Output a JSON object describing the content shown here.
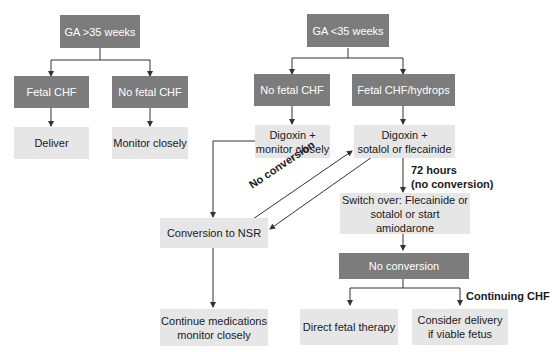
{
  "diagram": {
    "left_branch": {
      "root": "GA >35 weeks",
      "fetal_chf": "Fetal CHF",
      "no_fetal_chf": "No fetal CHF",
      "deliver": "Deliver",
      "monitor": "Monitor closely"
    },
    "right_branch": {
      "root": "GA <35 weeks",
      "no_fetal_chf": "No fetal CHF",
      "fetal_chf_hydrops": "Fetal CHF/hydrops",
      "digoxin_monitor_1": "Digoxin +",
      "digoxin_monitor_2": "monitor closely",
      "digoxin_sotalol_1": "Digoxin +",
      "digoxin_sotalol_2": "sotalol or flecainide",
      "conversion_nsr": "Conversion to NSR",
      "switch_over_1": "Switch over: Flecainide or",
      "switch_over_2": "sotalol or start amiodarone",
      "no_conversion_box": "No conversion",
      "continue_meds_1": "Continue medications",
      "continue_meds_2": "monitor closely",
      "direct_fetal": "Direct fetal therapy",
      "consider_delivery_1": "Consider delivery",
      "consider_delivery_2": "if viable fetus"
    },
    "labels": {
      "no_conversion_diag": "No conversion",
      "hours_72_1": "72 hours",
      "hours_72_2": "(no conversion)",
      "continuing_chf": "Continuing CHF"
    },
    "colors": {
      "dark_box": "#7c7c7c",
      "light_box": "#e6e6e6",
      "line": "#333333"
    }
  }
}
